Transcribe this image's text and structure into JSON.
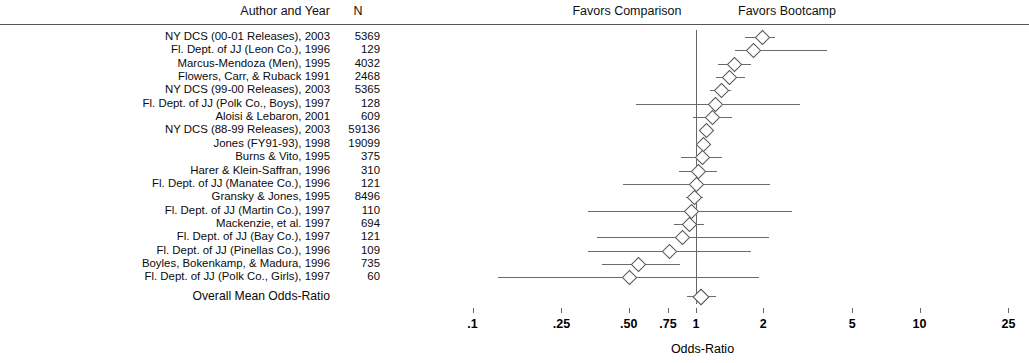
{
  "header": {
    "author_col": "Author and Year",
    "n_col": "N",
    "favors_left": "Favors Comparison",
    "favors_right": "Favors Bootcamp"
  },
  "overall": {
    "label": "Overall Mean Odds-Ratio",
    "odds_ratio": 1.05,
    "ci_low": 1.01,
    "ci_high": 1.11
  },
  "axis": {
    "title": "Odds-Ratio",
    "ticks": [
      ".1",
      ".25",
      ".50",
      ".75",
      "1",
      "2",
      "5",
      "10",
      "25"
    ],
    "tick_values": [
      0.1,
      0.25,
      0.5,
      0.75,
      1,
      2,
      5,
      10,
      25
    ],
    "scale": "log10",
    "null_value": 1
  },
  "chart_data": {
    "type": "forest",
    "title": "",
    "xlabel": "Odds-Ratio",
    "ylabel": "",
    "xscale": "log10",
    "xlim": [
      0.1,
      25
    ],
    "xticks": [
      0.1,
      0.25,
      0.5,
      0.75,
      1,
      2,
      5,
      10,
      25
    ],
    "xticklabels": [
      ".1",
      ".25",
      ".50",
      ".75",
      "1",
      "2",
      "5",
      "10",
      "25"
    ],
    "grid": false,
    "reference_line": 1,
    "annotations": [
      "Favors Comparison",
      "Favors Bootcamp"
    ],
    "columns": [
      "Author and Year",
      "N",
      "Odds-Ratio",
      "CI Low",
      "CI High"
    ],
    "studies": [
      {
        "label": "NY DCS (00-01 Releases), 2003",
        "n": "5369",
        "or": 1.97,
        "ci_low": 1.66,
        "ci_high": 2.25
      },
      {
        "label": "Fl. Dept. of JJ (Leon Co.), 1996",
        "n": "129",
        "or": 1.79,
        "ci_low": 1.49,
        "ci_high": 3.84
      },
      {
        "label": "Marcus-Mendoza (Men), 1995",
        "or": 1.48,
        "n": "4032",
        "ci_low": 1.26,
        "ci_high": 1.76
      },
      {
        "label": "Flowers, Carr, & Ruback 1991",
        "n": "2468",
        "or": 1.41,
        "ci_low": 1.23,
        "ci_high": 1.65
      },
      {
        "label": "NY DCS (99-00 Releases), 2003",
        "n": "5365",
        "or": 1.29,
        "ci_low": 1.16,
        "ci_high": 1.43
      },
      {
        "label": "Fl. Dept. of JJ (Polk Co., Boys), 1997",
        "n": "128",
        "or": 1.22,
        "ci_low": 0.54,
        "ci_high": 2.92
      },
      {
        "label": "Aloisi & Lebaron, 2001",
        "n": "609",
        "or": 1.18,
        "ci_low": 0.97,
        "ci_high": 1.45
      },
      {
        "label": "NY DCS (88-99 Releases), 2003",
        "n": "59136",
        "or": 1.11,
        "ci_low": 1.06,
        "ci_high": 1.17
      },
      {
        "label": "Jones (FY91-93), 1998",
        "n": "19099",
        "or": 1.08,
        "ci_low": 1.0,
        "ci_high": 1.17
      },
      {
        "label": "Burns & Vito, 1995",
        "n": "375",
        "or": 1.06,
        "ci_low": 0.86,
        "ci_high": 1.31
      },
      {
        "label": "Harer & Klein-Saffran, 1996",
        "n": "310",
        "or": 1.02,
        "ci_low": 0.84,
        "ci_high": 1.24
      },
      {
        "label": "Fl. Dept. of JJ (Manatee Co.), 1996",
        "n": "121",
        "or": 1.0,
        "ci_low": 0.47,
        "ci_high": 2.14
      },
      {
        "label": "Gransky & Jones, 1995",
        "n": "8496",
        "or": 0.98,
        "ci_low": 0.9,
        "ci_high": 1.07
      },
      {
        "label": "Fl. Dept. of JJ (Martin Co.), 1997",
        "n": "110",
        "or": 0.95,
        "ci_low": 0.33,
        "ci_high": 2.7
      },
      {
        "label": "Mackenzie, et al. 1997",
        "n": "694",
        "or": 0.93,
        "ci_low": 0.8,
        "ci_high": 1.09
      },
      {
        "label": "Fl. Dept. of JJ (Bay Co.), 1997",
        "n": "121",
        "or": 0.87,
        "ci_low": 0.36,
        "ci_high": 2.13
      },
      {
        "label": "Fl. Dept. of JJ (Pinellas Co.), 1996",
        "n": "109",
        "or": 0.76,
        "ci_low": 0.33,
        "ci_high": 1.77
      },
      {
        "label": "Boyles, Bokenkamp, & Madura, 1996",
        "n": "735",
        "or": 0.55,
        "ci_low": 0.38,
        "ci_high": 0.85
      },
      {
        "label": "Fl. Dept. of JJ (Polk Co., Girls), 1997",
        "n": "60",
        "or": 0.5,
        "ci_low": 0.13,
        "ci_high": 1.92
      }
    ]
  }
}
